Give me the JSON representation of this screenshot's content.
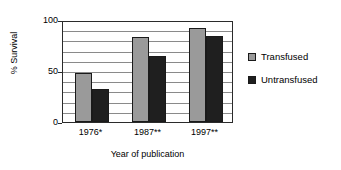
{
  "chart_data": {
    "type": "bar",
    "title": "",
    "xlabel": "Year of publication",
    "ylabel": "% Survival",
    "categories": [
      "1976*",
      "1987**",
      "1997**"
    ],
    "series": [
      {
        "name": "Transfused",
        "color": "#9a9a9a",
        "values": [
          48,
          83,
          92
        ]
      },
      {
        "name": "Untransfused",
        "color": "#1f1f1f",
        "values": [
          32,
          65,
          84
        ]
      }
    ],
    "ylim": [
      0,
      100
    ],
    "ytick_labels": [
      "0",
      "50",
      "100"
    ],
    "ytick_values": [
      0,
      50,
      100
    ],
    "gridline_values": [
      10,
      20,
      30,
      40,
      50,
      60,
      70,
      80,
      90
    ],
    "grid": true,
    "legend_position": "right"
  },
  "axes": {
    "y_title": "% Survival",
    "x_title": "Year of publication"
  },
  "legend": {
    "items": [
      {
        "label": "Transfused"
      },
      {
        "label": "Untransfused"
      }
    ]
  },
  "colors": {
    "transfused": "#9a9a9a",
    "untransfused": "#1f1f1f",
    "axis": "#2b2b2b",
    "gridline": "#8a8a8a",
    "background": "#ffffff"
  }
}
